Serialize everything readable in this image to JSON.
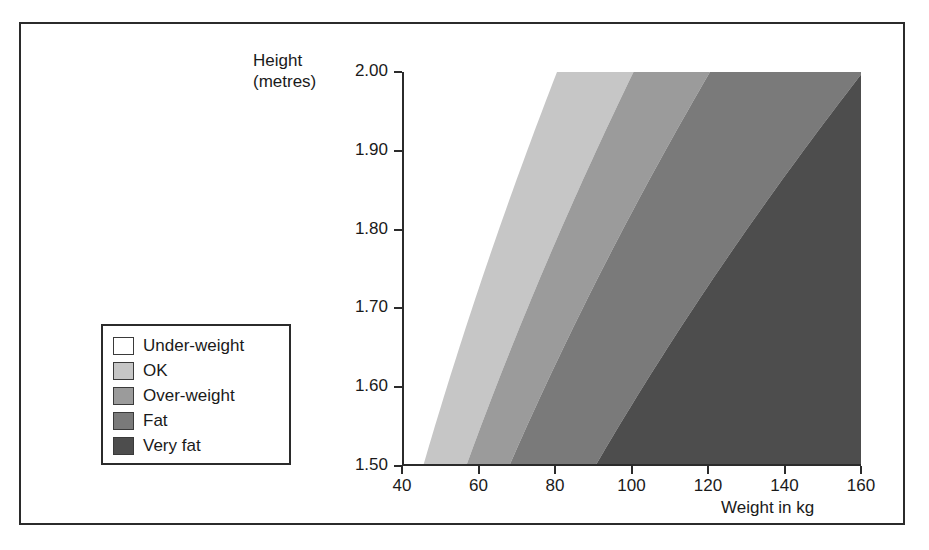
{
  "figure": {
    "frame_color": "#2b2b2b"
  },
  "legend": {
    "title": "",
    "items": [
      {
        "label": "Under-weight",
        "color": "#ffffff"
      },
      {
        "label": "OK",
        "color": "#c6c6c6"
      },
      {
        "label": "Over-weight",
        "color": "#9b9b9b"
      },
      {
        "label": "Fat",
        "color": "#7a7a7a"
      },
      {
        "label": "Very fat",
        "color": "#4d4d4d"
      }
    ]
  },
  "chart_data": {
    "type": "area",
    "title": "",
    "subtitle": "",
    "xlabel": "Weight in kg",
    "ylabel": "Height\n(metres)",
    "xlim": [
      40,
      160
    ],
    "ylim": [
      1.5,
      2.0
    ],
    "xticks": [
      40,
      60,
      80,
      100,
      120,
      140,
      160
    ],
    "xticklabels": [
      "40",
      "60",
      "80",
      "100",
      "120",
      "140",
      "160"
    ],
    "yticks": [
      1.5,
      1.6,
      1.7,
      1.8,
      1.9,
      2.0
    ],
    "yticklabels": [
      "1.50",
      "1.60",
      "1.70",
      "1.80",
      "1.90",
      "2.00"
    ],
    "grid": false,
    "legend_position": "outside-left",
    "bands": [
      {
        "name": "Under-weight",
        "bmi_min": 0,
        "bmi_max": 20,
        "color": "#ffffff"
      },
      {
        "name": "OK",
        "bmi_min": 20,
        "bmi_max": 25,
        "color": "#c6c6c6"
      },
      {
        "name": "Over-weight",
        "bmi_min": 25,
        "bmi_max": 30,
        "color": "#9b9b9b"
      },
      {
        "name": "Fat",
        "bmi_min": 30,
        "bmi_max": 40,
        "color": "#7a7a7a"
      },
      {
        "name": "Very fat",
        "bmi_min": 40,
        "bmi_max": 999,
        "color": "#4d4d4d"
      }
    ],
    "boundary_lines": [
      {
        "bmi": 20,
        "weight_at_h150": 45.0,
        "weight_at_h200": 80.0
      },
      {
        "bmi": 25,
        "weight_at_h150": 56.3,
        "weight_at_h200": 100.0
      },
      {
        "bmi": 30,
        "weight_at_h150": 67.5,
        "weight_at_h200": 120.0
      },
      {
        "bmi": 40,
        "weight_at_h150": 90.0,
        "weight_at_h200": 160.0
      }
    ]
  }
}
